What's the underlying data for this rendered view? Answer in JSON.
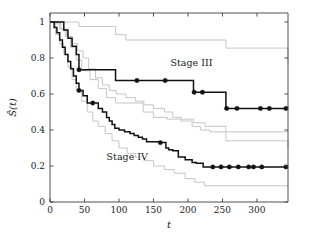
{
  "chart_data": {
    "type": "line",
    "title": "",
    "subtitle": "",
    "xlabel": "t",
    "ylabel": "Ŝ(t)",
    "xlim": [
      0,
      345
    ],
    "ylim": [
      0,
      1.05
    ],
    "xticks": [
      0,
      50,
      100,
      150,
      200,
      250,
      300
    ],
    "yticks": [
      0,
      0.2,
      0.4,
      0.6,
      0.8,
      1
    ],
    "xticklabels": [
      "0",
      "50",
      "100",
      "150",
      "200",
      "250",
      "300"
    ],
    "yticklabels": [
      "0",
      "0.2",
      "0.4",
      "0.6",
      "0.8",
      "1"
    ],
    "grid": false,
    "legend_position": "inline-annotations",
    "step_style": "post",
    "colors": {
      "estimate": "#111111",
      "confidence_band": "#c0c0c0",
      "axis": "#3c3c3c",
      "background": "#ffffff"
    },
    "annotations": [
      {
        "name": "stage-iii-label",
        "text": "Stage III",
        "x": 205,
        "y": 0.755
      },
      {
        "name": "stage-iv-label",
        "text": "Stage IV",
        "x": 112,
        "y": 0.235
      }
    ],
    "series": [
      {
        "name": "Stage III",
        "role": "estimate",
        "color": "#111111",
        "x": [
          0,
          14,
          20,
          26,
          32,
          38,
          42,
          95,
          208,
          225,
          255,
          345
        ],
        "values": [
          1.0,
          1.0,
          0.955,
          0.91,
          0.865,
          0.82,
          0.735,
          0.675,
          0.61,
          0.61,
          0.52,
          0.52
        ],
        "censored_points": [
          {
            "x": 42,
            "y": 0.735
          },
          {
            "x": 126,
            "y": 0.675
          },
          {
            "x": 167,
            "y": 0.675
          },
          {
            "x": 209,
            "y": 0.61
          },
          {
            "x": 221,
            "y": 0.61
          },
          {
            "x": 256,
            "y": 0.52
          },
          {
            "x": 271,
            "y": 0.52
          },
          {
            "x": 305,
            "y": 0.52
          },
          {
            "x": 318,
            "y": 0.52
          },
          {
            "x": 342,
            "y": 0.52
          }
        ]
      },
      {
        "name": "Stage III upper CI",
        "role": "confidence_band",
        "color": "#c0c0c0",
        "x": [
          0,
          20,
          42,
          95,
          110,
          208,
          255,
          345
        ],
        "values": [
          1.0,
          1.0,
          0.975,
          0.93,
          0.9,
          0.9,
          0.855,
          0.775
        ]
      },
      {
        "name": "Stage III lower CI",
        "role": "confidence_band",
        "color": "#c0c0c0",
        "x": [
          0,
          14,
          22,
          30,
          38,
          46,
          58,
          70,
          82,
          95,
          135,
          150,
          170,
          190,
          208,
          225,
          255,
          345
        ],
        "values": [
          1.0,
          0.96,
          0.92,
          0.86,
          0.79,
          0.73,
          0.68,
          0.63,
          0.58,
          0.55,
          0.5,
          0.47,
          0.46,
          0.46,
          0.44,
          0.42,
          0.34,
          0.3
        ]
      },
      {
        "name": "Stage IV",
        "role": "estimate",
        "color": "#111111",
        "x": [
          0,
          6,
          10,
          14,
          18,
          22,
          26,
          30,
          34,
          38,
          42,
          48,
          54,
          62,
          70,
          76,
          82,
          86,
          90,
          94,
          100,
          108,
          116,
          122,
          128,
          134,
          140,
          160,
          168,
          172,
          178,
          186,
          196,
          206,
          212,
          222,
          232,
          345
        ],
        "values": [
          1.0,
          0.97,
          0.94,
          0.9,
          0.86,
          0.82,
          0.78,
          0.74,
          0.7,
          0.66,
          0.62,
          0.59,
          0.55,
          0.55,
          0.52,
          0.5,
          0.47,
          0.45,
          0.43,
          0.41,
          0.4,
          0.39,
          0.38,
          0.37,
          0.36,
          0.35,
          0.335,
          0.33,
          0.3,
          0.29,
          0.285,
          0.25,
          0.235,
          0.22,
          0.215,
          0.195,
          0.195,
          0.195
        ],
        "censored_points": [
          {
            "x": 42,
            "y": 0.62
          },
          {
            "x": 62,
            "y": 0.55
          },
          {
            "x": 160,
            "y": 0.33
          },
          {
            "x": 236,
            "y": 0.195
          },
          {
            "x": 248,
            "y": 0.195
          },
          {
            "x": 260,
            "y": 0.195
          },
          {
            "x": 273,
            "y": 0.195
          },
          {
            "x": 288,
            "y": 0.195
          },
          {
            "x": 295,
            "y": 0.195
          },
          {
            "x": 307,
            "y": 0.195
          },
          {
            "x": 342,
            "y": 0.195
          }
        ]
      },
      {
        "name": "Stage IV upper CI",
        "role": "confidence_band",
        "color": "#c0c0c0",
        "x": [
          0,
          8,
          16,
          24,
          32,
          40,
          48,
          56,
          66,
          76,
          86,
          96,
          110,
          124,
          136,
          150,
          166,
          178,
          190,
          206,
          218,
          232,
          345
        ],
        "values": [
          1.0,
          0.99,
          0.96,
          0.92,
          0.88,
          0.84,
          0.8,
          0.74,
          0.69,
          0.65,
          0.62,
          0.6,
          0.58,
          0.56,
          0.54,
          0.52,
          0.5,
          0.47,
          0.45,
          0.42,
          0.4,
          0.39,
          0.39
        ]
      },
      {
        "name": "Stage IV lower CI",
        "role": "confidence_band",
        "color": "#c0c0c0",
        "x": [
          0,
          8,
          14,
          20,
          26,
          32,
          38,
          46,
          54,
          62,
          70,
          80,
          90,
          100,
          112,
          124,
          136,
          150,
          166,
          180,
          196,
          210,
          224,
          345
        ],
        "values": [
          1.0,
          0.93,
          0.88,
          0.82,
          0.75,
          0.68,
          0.62,
          0.56,
          0.5,
          0.45,
          0.42,
          0.38,
          0.34,
          0.3,
          0.27,
          0.25,
          0.23,
          0.2,
          0.18,
          0.16,
          0.13,
          0.11,
          0.09,
          0.09
        ]
      }
    ]
  },
  "figure": {
    "plot_box": {
      "left": 50,
      "top": 13,
      "right": 288,
      "bottom": 202
    }
  }
}
